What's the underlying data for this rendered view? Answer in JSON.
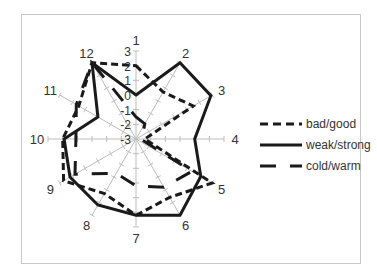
{
  "chart_data": {
    "type": "radar",
    "title": "",
    "categories": [
      "1",
      "2",
      "3",
      "4",
      "5",
      "6",
      "7",
      "8",
      "9",
      "10",
      "11",
      "12"
    ],
    "rlim": [
      -3,
      3
    ],
    "r_ticks": [
      "-3",
      "-2",
      "-1",
      "0",
      "1",
      "2",
      "3"
    ],
    "grid": true,
    "legend_position": "right",
    "series": [
      {
        "name": "bad/good",
        "style": "dashed",
        "values": [
          2,
          0.7,
          1.5,
          -2.4,
          3,
          1.6,
          2.2,
          1.3,
          2.7,
          2,
          1.5,
          3
        ]
      },
      {
        "name": "weak/strong",
        "style": "solid",
        "values": [
          0,
          3,
          2.9,
          1,
          2.1,
          3,
          2.2,
          2.2,
          2.2,
          1.9,
          0,
          3
        ]
      },
      {
        "name": "cold/warm",
        "style": "long-dash",
        "values": [
          -1.5,
          -1.8,
          -2.5,
          -2.7,
          1.4,
          0.8,
          0.2,
          -0.3,
          1.8,
          1.1,
          1.7,
          3
        ]
      }
    ]
  },
  "legend": {
    "items": [
      {
        "label": "bad/good"
      },
      {
        "label": "weak/strong"
      },
      {
        "label": "cold/warm"
      }
    ]
  },
  "colors": {
    "series": "#1a1a1a",
    "axis": "#bdbdbd",
    "frame": "#c8c8c8"
  }
}
